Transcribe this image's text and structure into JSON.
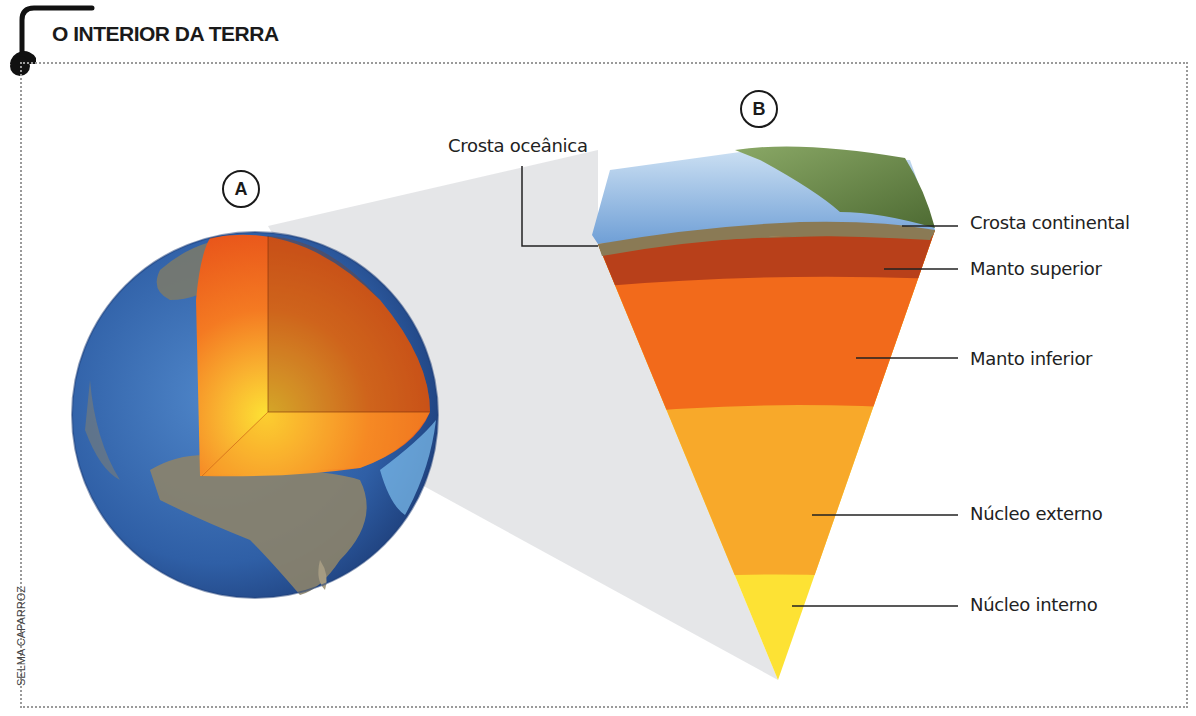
{
  "title": "O INTERIOR DA TERRA",
  "credit": "SELMA CAPARROZ",
  "figures": {
    "a": {
      "label": "A",
      "description": "Globo terrestre com recorte mostrando camadas internas"
    },
    "b": {
      "label": "B",
      "description": "Corte ampliado das camadas da Terra"
    }
  },
  "layers": [
    {
      "name": "Crosta oceânica",
      "color": "#6f9fd6"
    },
    {
      "name": "Crosta continental",
      "color": "#8a7a55"
    },
    {
      "name": "Manto superior",
      "color": "#b8401a"
    },
    {
      "name": "Manto inferior",
      "color": "#f26a1b"
    },
    {
      "name": "Núcleo externo",
      "color": "#f8a92a"
    },
    {
      "name": "Núcleo interno",
      "color": "#fde234"
    }
  ]
}
